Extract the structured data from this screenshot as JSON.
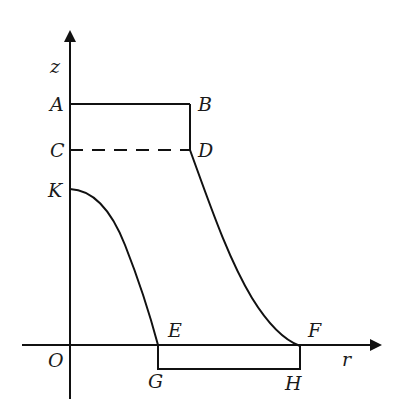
{
  "diagram": {
    "type": "axisymmetric cross-section",
    "axes": {
      "vertical": {
        "label": "z"
      },
      "horizontal": {
        "label": "r"
      },
      "origin": {
        "label": "O"
      }
    },
    "points": {
      "A": "A",
      "B": "B",
      "C": "C",
      "D": "D",
      "K": "K",
      "E": "E",
      "F": "F",
      "G": "G",
      "H": "H"
    },
    "segments": [
      {
        "from": "A",
        "to": "B",
        "style": "solid"
      },
      {
        "from": "B",
        "to": "D",
        "style": "solid"
      },
      {
        "from": "C",
        "to": "D",
        "style": "dashed"
      },
      {
        "from": "K",
        "to": "E",
        "style": "curve"
      },
      {
        "from": "D",
        "to": "F",
        "style": "curve"
      },
      {
        "from": "E",
        "to": "G",
        "style": "solid"
      },
      {
        "from": "G",
        "to": "H",
        "style": "solid"
      },
      {
        "from": "H",
        "to": "F",
        "style": "solid"
      }
    ],
    "colors": {
      "line": "#111111",
      "background": "#ffffff"
    }
  }
}
